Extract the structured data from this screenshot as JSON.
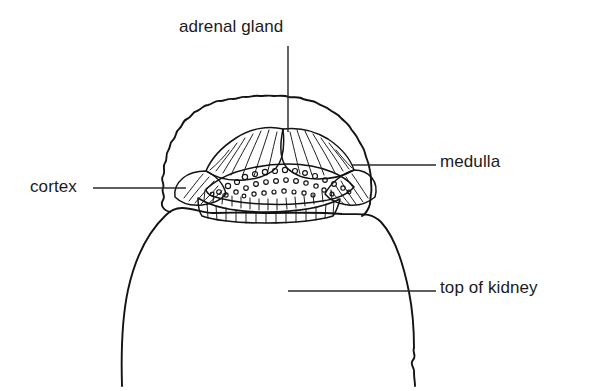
{
  "figure": {
    "style": "black-and-white line drawing",
    "background_color": "#ffffff",
    "ink_color": "#131313",
    "text_color": "#1b1b1b"
  },
  "labels": {
    "adrenal_gland": "adrenal gland",
    "medulla": "medulla",
    "cortex": "cortex",
    "top_of_kidney": "top of kidney"
  },
  "leaders": [
    {
      "name": "adrenal-gland-leader",
      "orientation": "vertical",
      "from_label": "adrenal gland"
    },
    {
      "name": "medulla-leader",
      "orientation": "horizontal",
      "from_label": "medulla"
    },
    {
      "name": "cortex-leader",
      "orientation": "horizontal",
      "from_label": "cortex"
    },
    {
      "name": "top-of-kidney-leader",
      "orientation": "horizontal",
      "from_label": "top of kidney"
    }
  ],
  "structures": [
    {
      "name": "adrenal-gland-capsule",
      "description": "scalloped lobulated outer capsule"
    },
    {
      "name": "adrenal-cortex",
      "description": "striated outer glandular zone"
    },
    {
      "name": "adrenal-medulla",
      "description": "central stippled zone"
    },
    {
      "name": "kidney-top",
      "description": "dome-shaped superior pole of kidney"
    }
  ]
}
